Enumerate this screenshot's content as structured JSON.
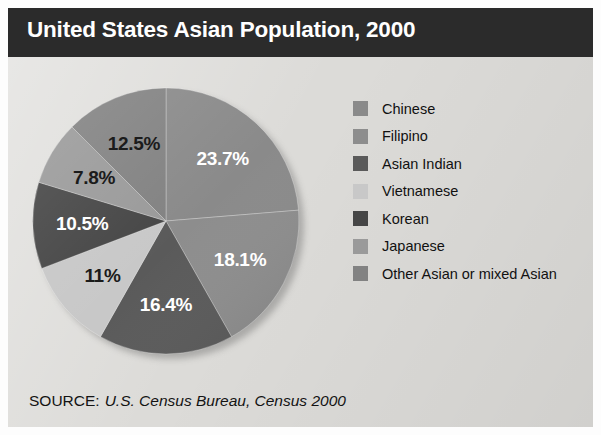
{
  "header": {
    "title": "United States Asian Population, 2000",
    "bar_color": "#2b2b2b",
    "text_color": "#ffffff"
  },
  "source": {
    "label": "SOURCE:",
    "value": "U.S. Census Bureau, Census 2000"
  },
  "legend": {
    "position": "right",
    "items": [
      {
        "label": "Chinese",
        "color": "#8a8a8a"
      },
      {
        "label": "Filipino",
        "color": "#8d8d8d"
      },
      {
        "label": "Asian Indian",
        "color": "#5a5a5a"
      },
      {
        "label": "Vietnamese",
        "color": "#c8c8c8"
      },
      {
        "label": "Korean",
        "color": "#464646"
      },
      {
        "label": "Japanese",
        "color": "#9a9a9a"
      },
      {
        "label": "Other Asian or mixed Asian",
        "color": "#828282"
      }
    ]
  },
  "chart_data": {
    "type": "pie",
    "title": "United States Asian Population, 2000",
    "subtitle": "",
    "xlabel": "",
    "ylabel": "",
    "units": "percent",
    "start_angle_deg": 0,
    "direction": "clockwise",
    "legend_position": "right",
    "grid": false,
    "categories": [
      "Chinese",
      "Filipino",
      "Asian Indian",
      "Vietnamese",
      "Korean",
      "Japanese",
      "Other Asian or mixed Asian"
    ],
    "values": [
      23.7,
      18.1,
      16.4,
      11.0,
      10.5,
      7.8,
      12.5
    ],
    "labels": [
      "23.7%",
      "18.1%",
      "16.4%",
      "11%",
      "10.5%",
      "7.8%",
      "12.5%"
    ],
    "colors": [
      "#8a8a8a",
      "#8d8d8d",
      "#5a5a5a",
      "#c8c8c8",
      "#464646",
      "#9a9a9a",
      "#828282"
    ],
    "label_colors": [
      "light",
      "light",
      "light",
      "dark",
      "light",
      "dark",
      "dark"
    ],
    "total": 100.0,
    "annotations": [
      "SOURCE: U.S. Census Bureau, Census 2000"
    ]
  }
}
